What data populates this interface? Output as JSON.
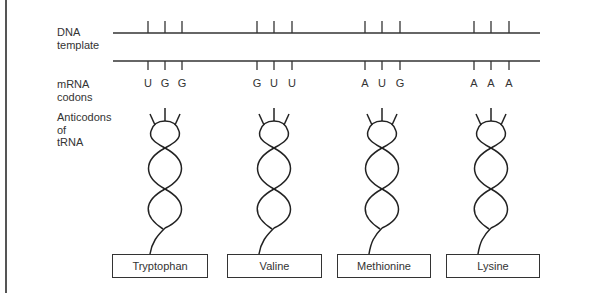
{
  "labels": {
    "dna": [
      "DNA",
      "template"
    ],
    "mrna": [
      "mRNA",
      "codons"
    ],
    "trna": [
      "Anticodons",
      "of",
      "tRNA"
    ]
  },
  "groups": [
    {
      "codon": [
        "U",
        "G",
        "G"
      ],
      "amino_acid": "Tryptophan"
    },
    {
      "codon": [
        "G",
        "U",
        "U"
      ],
      "amino_acid": "Valine"
    },
    {
      "codon": [
        "A",
        "U",
        "G"
      ],
      "amino_acid": "Methionine"
    },
    {
      "codon": [
        "A",
        "A",
        "A"
      ],
      "amino_acid": "Lysine"
    }
  ],
  "colors": {
    "line": "#333333",
    "background": "#ffffff"
  }
}
